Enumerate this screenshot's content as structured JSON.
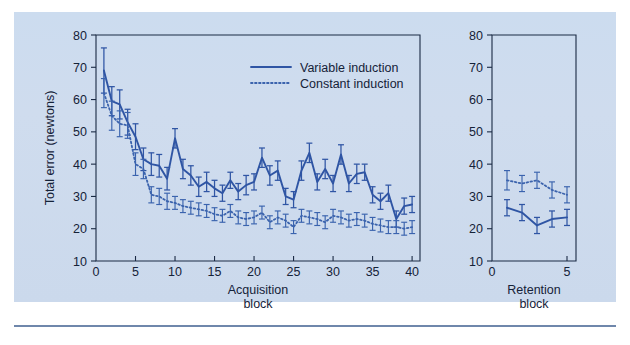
{
  "figure": {
    "background_color": "#cdd9ec",
    "accent_color": "#2f55a4",
    "secondary_color": "#3b63ad",
    "axis_color": "#152238"
  },
  "legend": {
    "position": "top-center-right",
    "entries": [
      {
        "label": "Variable induction",
        "style": "solid",
        "color": "#2f55a4"
      },
      {
        "label": "Constant induction",
        "style": "dotted",
        "color": "#3b63ad"
      }
    ]
  },
  "chart_data": [
    {
      "type": "line",
      "panel": "acquisition",
      "title": "",
      "xlabel": "Acquisition block",
      "xlabel_lines": [
        "Acquisition",
        "block"
      ],
      "ylabel": "Total error (newtons)",
      "xlim": [
        0,
        41
      ],
      "ylim": [
        10,
        80
      ],
      "xticks": [
        0,
        5,
        10,
        15,
        20,
        25,
        30,
        35,
        40
      ],
      "yticks": [
        10,
        20,
        30,
        40,
        50,
        60,
        70,
        80
      ],
      "grid": false,
      "x": [
        1,
        2,
        3,
        4,
        5,
        6,
        7,
        8,
        9,
        10,
        11,
        12,
        13,
        14,
        15,
        16,
        17,
        18,
        19,
        20,
        21,
        22,
        23,
        24,
        25,
        26,
        27,
        28,
        29,
        30,
        31,
        32,
        33,
        34,
        35,
        36,
        37,
        38,
        39,
        40
      ],
      "series": [
        {
          "name": "Variable induction",
          "style": "solid",
          "color": "#2f55a4",
          "values": [
            69.0,
            59.5,
            58.5,
            53.0,
            48.5,
            41.5,
            40.0,
            39.5,
            35.5,
            48.0,
            38.5,
            36.5,
            33.0,
            34.5,
            32.5,
            31.0,
            35.0,
            31.5,
            33.5,
            34.5,
            42.0,
            36.5,
            38.0,
            30.0,
            29.0,
            38.0,
            43.5,
            34.5,
            38.5,
            34.0,
            43.0,
            34.0,
            37.0,
            37.5,
            30.5,
            28.5,
            31.0,
            23.0,
            27.0,
            27.5
          ],
          "errors": [
            7.0,
            4.5,
            4.5,
            4.0,
            4.0,
            3.5,
            3.5,
            3.5,
            3.5,
            3.0,
            3.0,
            3.0,
            3.0,
            3.0,
            2.5,
            2.5,
            2.5,
            2.5,
            3.0,
            2.5,
            3.0,
            3.0,
            3.0,
            2.5,
            2.5,
            3.0,
            3.0,
            2.5,
            3.0,
            2.5,
            3.0,
            2.5,
            3.0,
            2.5,
            2.5,
            2.5,
            2.5,
            2.5,
            2.5,
            2.5
          ]
        },
        {
          "name": "Constant induction",
          "style": "dotted",
          "color": "#3b63ad",
          "values": [
            62.0,
            55.0,
            52.5,
            52.0,
            40.0,
            38.5,
            30.5,
            30.0,
            28.5,
            28.0,
            27.0,
            26.5,
            26.0,
            25.5,
            24.5,
            24.0,
            25.5,
            23.5,
            23.0,
            23.5,
            25.0,
            22.0,
            23.5,
            22.5,
            20.5,
            24.0,
            23.5,
            23.0,
            22.0,
            24.0,
            23.5,
            22.5,
            23.0,
            22.5,
            21.5,
            21.0,
            20.5,
            20.5,
            20.0,
            20.5
          ],
          "errors": [
            4.5,
            4.5,
            4.0,
            4.0,
            3.5,
            3.0,
            2.5,
            2.5,
            2.5,
            2.0,
            2.0,
            2.0,
            2.0,
            2.0,
            2.0,
            2.0,
            2.0,
            2.0,
            2.0,
            2.0,
            2.0,
            2.0,
            2.0,
            2.0,
            2.0,
            2.0,
            2.0,
            2.0,
            2.0,
            2.0,
            2.0,
            2.0,
            2.0,
            2.0,
            2.0,
            2.0,
            2.0,
            2.0,
            2.0,
            2.0
          ]
        }
      ]
    },
    {
      "type": "line",
      "panel": "retention",
      "title": "",
      "xlabel": "Retention block",
      "xlabel_lines": [
        "Retention",
        "block"
      ],
      "ylabel": "",
      "xlim": [
        0,
        5.6
      ],
      "ylim": [
        10,
        80
      ],
      "xticks": [
        0,
        5
      ],
      "yticks": [
        10,
        20,
        30,
        40,
        50,
        60,
        70,
        80
      ],
      "grid": false,
      "x": [
        1,
        2,
        3,
        4,
        5
      ],
      "series": [
        {
          "name": "Variable induction",
          "style": "solid",
          "color": "#2f55a4",
          "values": [
            26.5,
            25.0,
            21.0,
            23.0,
            23.5
          ],
          "errors": [
            2.5,
            2.5,
            2.5,
            2.5,
            2.5
          ]
        },
        {
          "name": "Constant induction",
          "style": "dotted",
          "color": "#3b63ad",
          "values": [
            35.0,
            34.0,
            35.0,
            32.0,
            30.5
          ],
          "errors": [
            3.0,
            2.5,
            2.5,
            2.5,
            2.5
          ]
        }
      ]
    }
  ]
}
